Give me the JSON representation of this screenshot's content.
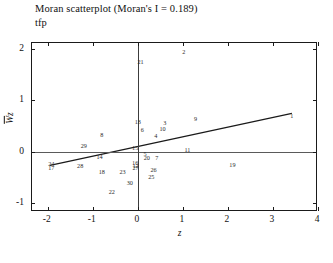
{
  "chart_data": {
    "type": "scatter",
    "title": "Moran scatterplot (Moran's I = 0.189)",
    "subtitle": "tfp",
    "xlabel": "z",
    "ylabel": "Wz",
    "xlim": [
      -2.35,
      4.0
    ],
    "ylim": [
      -1.18,
      2.12
    ],
    "xticks": [
      -2,
      -1,
      0,
      1,
      2,
      3,
      4
    ],
    "xtick_labels": [
      "-2",
      "-1",
      "0",
      "1",
      "2",
      "3",
      "4"
    ],
    "yticks": [
      -1,
      0,
      1,
      2
    ],
    "ytick_labels": [
      "-1",
      "0",
      "1",
      "2"
    ],
    "grid": false,
    "legend": "none",
    "reference_lines": {
      "horizontal_y": 0.0,
      "vertical_x": 0.0
    },
    "regression_line": {
      "slope": 0.189,
      "intercept": 0.1,
      "x_start": -1.95,
      "y_start": -0.268,
      "x_end": 3.42,
      "y_end": 0.746
    },
    "point_label_field": "id",
    "points": [
      {
        "id": "1",
        "x": 3.42,
        "y": 0.7
      },
      {
        "id": "2",
        "x": 1.02,
        "y": 1.95
      },
      {
        "id": "3",
        "x": 0.6,
        "y": 0.56
      },
      {
        "id": "4",
        "x": 0.4,
        "y": 0.3
      },
      {
        "id": "5",
        "x": 0.16,
        "y": -0.05
      },
      {
        "id": "6",
        "x": 0.1,
        "y": 0.42
      },
      {
        "id": "7",
        "x": 0.42,
        "y": -0.12
      },
      {
        "id": "8",
        "x": -0.8,
        "y": 0.33
      },
      {
        "id": "9",
        "x": 1.28,
        "y": 0.64
      },
      {
        "id": "10",
        "x": 0.55,
        "y": 0.44
      },
      {
        "id": "11",
        "x": 1.1,
        "y": 0.04
      },
      {
        "id": "12",
        "x": -0.05,
        "y": -0.28
      },
      {
        "id": "13",
        "x": 0.0,
        "y": 0.57
      },
      {
        "id": "14",
        "x": -0.85,
        "y": -0.11
      },
      {
        "id": "15",
        "x": -0.06,
        "y": 0.07
      },
      {
        "id": "16",
        "x": -0.06,
        "y": -0.22
      },
      {
        "id": "17",
        "x": -1.92,
        "y": -0.33
      },
      {
        "id": "18",
        "x": -0.8,
        "y": -0.4
      },
      {
        "id": "19",
        "x": 2.1,
        "y": -0.26
      },
      {
        "id": "20",
        "x": 0.2,
        "y": -0.13
      },
      {
        "id": "21",
        "x": 0.06,
        "y": 1.74
      },
      {
        "id": "22",
        "x": -0.58,
        "y": -0.78
      },
      {
        "id": "23",
        "x": -0.34,
        "y": -0.4
      },
      {
        "id": "24",
        "x": -1.92,
        "y": -0.24
      },
      {
        "id": "25",
        "x": 0.3,
        "y": -0.5
      },
      {
        "id": "26",
        "x": 0.35,
        "y": -0.36
      },
      {
        "id": "27",
        "x": -0.05,
        "y": -0.33
      },
      {
        "id": "28",
        "x": -1.28,
        "y": -0.28
      },
      {
        "id": "29",
        "x": -1.2,
        "y": 0.1
      },
      {
        "id": "30",
        "x": -0.18,
        "y": -0.62
      }
    ]
  }
}
